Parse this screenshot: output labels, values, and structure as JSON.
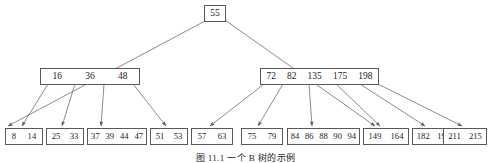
{
  "figure": {
    "caption": "图 11.1    一个 B 树的示例",
    "colors": {
      "box_border": "#585858",
      "edge": "#6e6e6e",
      "text": "#1a1a1a",
      "background": "#ffffff"
    }
  },
  "chart_data": {
    "type": "diagram",
    "diagram_kind": "b-tree",
    "title": "图 11.1    一个 B 树的示例",
    "levels": 3,
    "nodes": [
      {
        "id": "root",
        "level": 0,
        "keys": [
          "55"
        ],
        "x": 204,
        "y": 5,
        "width": 22,
        "height": 17
      },
      {
        "id": "internal-left",
        "level": 1,
        "keys": [
          "16",
          "36",
          "48"
        ],
        "x": 40,
        "y": 68,
        "width": 100,
        "height": 17
      },
      {
        "id": "internal-right",
        "level": 1,
        "keys": [
          "72",
          "82",
          "135",
          "175",
          "198"
        ],
        "x": 260,
        "y": 68,
        "width": 119,
        "height": 17
      },
      {
        "id": "leaf-1",
        "level": 2,
        "keys": [
          "8",
          "14"
        ],
        "x": 5,
        "y": 128,
        "width": 38,
        "height": 17
      },
      {
        "id": "leaf-2",
        "level": 2,
        "keys": [
          "25",
          "33"
        ],
        "x": 46,
        "y": 128,
        "width": 38,
        "height": 17
      },
      {
        "id": "leaf-3",
        "level": 2,
        "keys": [
          "37",
          "39",
          "44",
          "47"
        ],
        "x": 87,
        "y": 128,
        "width": 60,
        "height": 17
      },
      {
        "id": "leaf-4",
        "level": 2,
        "keys": [
          "51",
          "53"
        ],
        "x": 150,
        "y": 128,
        "width": 38,
        "height": 17
      },
      {
        "id": "leaf-5",
        "level": 2,
        "keys": [
          "57",
          "63"
        ],
        "x": 191,
        "y": 128,
        "width": 42,
        "height": 17
      },
      {
        "id": "leaf-6",
        "level": 2,
        "keys": [
          "75",
          "79"
        ],
        "x": 241,
        "y": 128,
        "width": 42,
        "height": 17
      },
      {
        "id": "leaf-7",
        "level": 2,
        "keys": [
          "84",
          "86",
          "88",
          "90",
          "94"
        ],
        "x": 287,
        "y": 128,
        "width": 73,
        "height": 17
      },
      {
        "id": "leaf-8",
        "level": 2,
        "keys": [
          "149",
          "164"
        ],
        "x": 363,
        "y": 128,
        "width": 46,
        "height": 17
      },
      {
        "id": "leaf-9",
        "level": 2,
        "keys": [
          "182",
          "195"
        ],
        "x": 412,
        "y": 128,
        "width": 43,
        "height": 17
      },
      {
        "id": "leaf-10",
        "level": 2,
        "keys": [
          "211",
          "215"
        ],
        "x": 443,
        "y": 128,
        "width": 44,
        "height": 17
      }
    ],
    "edges": [
      {
        "from": "root",
        "to": "internal-left",
        "x1": 205,
        "y1": 21,
        "x2": 8,
        "y2": 126
      },
      {
        "from": "root",
        "to": "internal-right",
        "x1": 225,
        "y1": 20,
        "x2": 375,
        "y2": 126
      },
      {
        "from": "internal-left",
        "to": "leaf-1",
        "x1": 48,
        "y1": 84,
        "x2": 22,
        "y2": 126
      },
      {
        "from": "internal-left",
        "to": "leaf-2",
        "x1": 75,
        "y1": 84,
        "x2": 62,
        "y2": 126
      },
      {
        "from": "internal-left",
        "to": "leaf-3",
        "x1": 104,
        "y1": 84,
        "x2": 101,
        "y2": 126
      },
      {
        "from": "internal-left",
        "to": "leaf-4",
        "x1": 133,
        "y1": 84,
        "x2": 166,
        "y2": 126
      },
      {
        "from": "internal-right",
        "to": "leaf-5",
        "x1": 264,
        "y1": 84,
        "x2": 210,
        "y2": 126
      },
      {
        "from": "internal-right",
        "to": "leaf-6",
        "x1": 283,
        "y1": 84,
        "x2": 258,
        "y2": 126
      },
      {
        "from": "internal-right",
        "to": "leaf-7",
        "x1": 309,
        "y1": 84,
        "x2": 312,
        "y2": 126
      },
      {
        "from": "internal-right",
        "to": "leaf-8",
        "x1": 336,
        "y1": 84,
        "x2": 380,
        "y2": 126
      },
      {
        "from": "internal-right",
        "to": "leaf-9",
        "x1": 360,
        "y1": 84,
        "x2": 425,
        "y2": 126
      },
      {
        "from": "internal-right",
        "to": "leaf-10",
        "x1": 378,
        "y1": 84,
        "x2": 462,
        "y2": 126
      }
    ]
  }
}
